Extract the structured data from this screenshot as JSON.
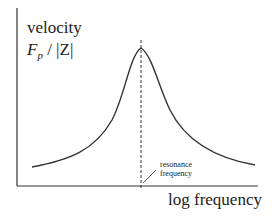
{
  "diagram": {
    "y_label_line1": "velocity",
    "y_label_F": "F",
    "y_label_sub": "p",
    "y_label_rest": " / |Z|",
    "x_label": "log frequency",
    "annotation_line1": "resonance",
    "annotation_line2": "frequency",
    "curve": "resonance peak (velocity vs log frequency)",
    "colors": {
      "line": "#333333",
      "background": "#ffffff"
    }
  }
}
